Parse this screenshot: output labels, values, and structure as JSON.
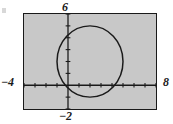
{
  "figure": {
    "kind": "graphing-calculator-window",
    "background_color": "#ffffff",
    "plot_fill_color": "#c8c8c8",
    "stroke_color": "#1a1a1a"
  },
  "labels": {
    "y_max": "6",
    "y_min": "−2",
    "x_min": "−4",
    "x_max": "8"
  },
  "chart_data": {
    "type": "scatter",
    "title": "",
    "xlabel": "",
    "ylabel": "",
    "xlim": [
      -4,
      8
    ],
    "ylim": [
      -2,
      6
    ],
    "grid": false,
    "legend": false,
    "x_tick_labels": [
      "−4",
      "8"
    ],
    "y_tick_labels": [
      "6",
      "−2"
    ],
    "x_tick_step": 1,
    "y_tick_step": 1,
    "axes": {
      "x_axis_y_value": 0,
      "y_axis_x_value": 0,
      "ticks_on_axes": true
    },
    "series": [
      {
        "name": "circle",
        "shape": "circle",
        "center": [
          2,
          2
        ],
        "radius": 3,
        "equation": "(x − 2)² + (y − 2)² = 9",
        "color": "#1a1a1a"
      }
    ]
  }
}
